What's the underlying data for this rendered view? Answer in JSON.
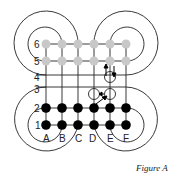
{
  "figure": {
    "caption": "Figure A",
    "columns": [
      "A",
      "B",
      "C",
      "D",
      "E",
      "F"
    ],
    "rows": [
      "1",
      "2",
      "3",
      "4",
      "5",
      "6"
    ],
    "colors": {
      "line": "#222222",
      "light_node": "#c8c8c8",
      "dark_node": "#000000",
      "crossing": "#ffffff"
    },
    "top_nodes": {
      "rows": [
        "6",
        "5"
      ],
      "style": "light-gray"
    },
    "bottom_nodes": {
      "rows": [
        "2",
        "1"
      ],
      "style": "black"
    },
    "crossings": [
      {
        "id": "crossing-d3",
        "at": "D3"
      },
      {
        "id": "crossing-e3",
        "at": "E3"
      },
      {
        "id": "crossing-e4",
        "at": "E4"
      }
    ],
    "arrows": [
      {
        "id": "arrow-up-e",
        "direction": "up"
      },
      {
        "id": "arrow-down-e",
        "direction": "down"
      },
      {
        "id": "arrow-left-e3",
        "direction": "left"
      },
      {
        "id": "arrow-diag-e3",
        "direction": "up-right"
      }
    ]
  }
}
